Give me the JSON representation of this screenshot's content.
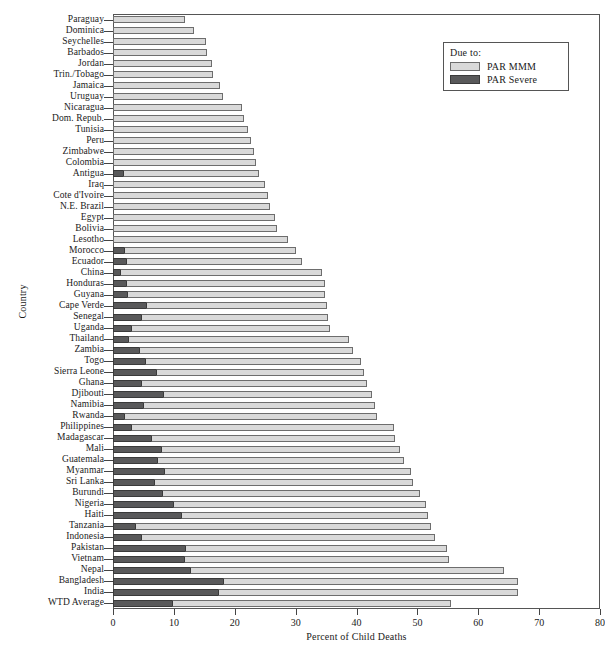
{
  "chart_data": {
    "type": "bar",
    "orientation": "horizontal",
    "stacked": true,
    "title": "",
    "xlabel": "Percent of Child Deaths",
    "ylabel": "Country",
    "xlim": [
      0,
      80
    ],
    "xticks": [
      0,
      10,
      20,
      30,
      40,
      50,
      60,
      70,
      80
    ],
    "xtick_labels": [
      "0",
      "10",
      "20",
      "30",
      "40",
      "50",
      "60",
      "70",
      "80"
    ],
    "grid": false,
    "legend": {
      "title": "Due to:",
      "position": "top-right",
      "entries": [
        {
          "name": "PAR MMM",
          "color": "#d9d9d9"
        },
        {
          "name": "PAR Severe",
          "color": "#59595a"
        }
      ]
    },
    "series": [
      {
        "name": "PAR Severe",
        "color": "#59595a"
      },
      {
        "name": "PAR MMM",
        "color": "#d9d9d9"
      }
    ],
    "categories": [
      "Paraguay",
      "Dominica",
      "Seychelles",
      "Barbados",
      "Jordan",
      "Trin./Tobago",
      "Jamaica",
      "Uruguay",
      "Nicaragua",
      "Dom. Repub.",
      "Tunisia",
      "Peru",
      "Zimbabwe",
      "Colombia",
      "Antigua",
      "Iraq",
      "Cote d'Ivoire",
      "N.E. Brazil",
      "Egypt",
      "Bolivia",
      "Lesotho",
      "Morocco",
      "Ecuador",
      "China",
      "Honduras",
      "Guyana",
      "Cape Verde",
      "Senegal",
      "Uganda",
      "Thailand",
      "Zambia",
      "Togo",
      "Sierra Leone",
      "Ghana",
      "Djibouti",
      "Namibia",
      "Rwanda",
      "Philippines",
      "Madagascar",
      "Mali",
      "Guatemala",
      "Myanmar",
      "Sri Lanka",
      "Burundi",
      "Nigeria",
      "Haiti",
      "Tanzania",
      "Indonesia",
      "Pakistan",
      "Vietnam",
      "Nepal",
      "Bangladesh",
      "India",
      "WTD Average"
    ],
    "rows": [
      {
        "country": "Paraguay",
        "severe": 0.0,
        "mmm": 11.9,
        "total": 11.9
      },
      {
        "country": "Dominica",
        "severe": 0.0,
        "mmm": 13.3,
        "total": 13.3
      },
      {
        "country": "Seychelles",
        "severe": 0.0,
        "mmm": 15.2,
        "total": 15.2
      },
      {
        "country": "Barbados",
        "severe": 0.0,
        "mmm": 15.4,
        "total": 15.4
      },
      {
        "country": "Jordan",
        "severe": 0.0,
        "mmm": 16.3,
        "total": 16.3
      },
      {
        "country": "Trin./Tobago",
        "severe": 0.0,
        "mmm": 16.5,
        "total": 16.5
      },
      {
        "country": "Jamaica",
        "severe": 0.0,
        "mmm": 17.5,
        "total": 17.5
      },
      {
        "country": "Uruguay",
        "severe": 0.0,
        "mmm": 18.1,
        "total": 18.1
      },
      {
        "country": "Nicaragua",
        "severe": 0.0,
        "mmm": 21.2,
        "total": 21.2
      },
      {
        "country": "Dom. Repub.",
        "severe": 0.0,
        "mmm": 21.6,
        "total": 21.6
      },
      {
        "country": "Tunisia",
        "severe": 0.0,
        "mmm": 22.1,
        "total": 22.1
      },
      {
        "country": "Peru",
        "severe": 0.0,
        "mmm": 22.6,
        "total": 22.6
      },
      {
        "country": "Zimbabwe",
        "severe": 0.0,
        "mmm": 23.1,
        "total": 23.1
      },
      {
        "country": "Colombia",
        "severe": 0.0,
        "mmm": 23.5,
        "total": 23.5
      },
      {
        "country": "Antigua",
        "severe": 1.6,
        "mmm": 22.4,
        "total": 24.0
      },
      {
        "country": "Iraq",
        "severe": 0.0,
        "mmm": 24.9,
        "total": 24.9
      },
      {
        "country": "Cote d'Ivoire",
        "severe": 0.0,
        "mmm": 25.5,
        "total": 25.5
      },
      {
        "country": "N.E. Brazil",
        "severe": 0.0,
        "mmm": 25.8,
        "total": 25.8
      },
      {
        "country": "Egypt",
        "severe": 0.0,
        "mmm": 26.6,
        "total": 26.6
      },
      {
        "country": "Bolivia",
        "severe": 0.0,
        "mmm": 27.0,
        "total": 27.0
      },
      {
        "country": "Lesotho",
        "severe": 0.0,
        "mmm": 28.8,
        "total": 28.8
      },
      {
        "country": "Morocco",
        "severe": 1.8,
        "mmm": 28.2,
        "total": 30.0
      },
      {
        "country": "Ecuador",
        "severe": 2.2,
        "mmm": 28.8,
        "total": 31.0
      },
      {
        "country": "China",
        "severe": 1.1,
        "mmm": 33.3,
        "total": 34.4
      },
      {
        "country": "Honduras",
        "severe": 2.2,
        "mmm": 32.6,
        "total": 34.8
      },
      {
        "country": "Guyana",
        "severe": 2.3,
        "mmm": 32.6,
        "total": 34.9
      },
      {
        "country": "Cape Verde",
        "severe": 5.4,
        "mmm": 29.7,
        "total": 35.1
      },
      {
        "country": "Senegal",
        "severe": 4.6,
        "mmm": 30.8,
        "total": 35.4
      },
      {
        "country": "Uganda",
        "severe": 2.9,
        "mmm": 32.7,
        "total": 35.6
      },
      {
        "country": "Thailand",
        "severe": 2.4,
        "mmm": 36.4,
        "total": 38.8
      },
      {
        "country": "Zambia",
        "severe": 4.3,
        "mmm": 35.2,
        "total": 39.5
      },
      {
        "country": "Togo",
        "severe": 5.3,
        "mmm": 35.4,
        "total": 40.7
      },
      {
        "country": "Sierra Leone",
        "severe": 7.1,
        "mmm": 34.2,
        "total": 41.3
      },
      {
        "country": "Ghana",
        "severe": 4.6,
        "mmm": 37.1,
        "total": 41.7
      },
      {
        "country": "Djibouti",
        "severe": 8.2,
        "mmm": 34.3,
        "total": 42.5
      },
      {
        "country": "Namibia",
        "severe": 4.9,
        "mmm": 38.1,
        "total": 43.0
      },
      {
        "country": "Rwanda",
        "severe": 1.8,
        "mmm": 41.6,
        "total": 43.4
      },
      {
        "country": "Philippines",
        "severe": 3.0,
        "mmm": 43.1,
        "total": 46.1
      },
      {
        "country": "Madagascar",
        "severe": 6.3,
        "mmm": 40.1,
        "total": 46.4
      },
      {
        "country": "Mali",
        "severe": 7.9,
        "mmm": 39.3,
        "total": 47.2
      },
      {
        "country": "Guatemala",
        "severe": 7.3,
        "mmm": 40.5,
        "total": 47.8
      },
      {
        "country": "Myanmar",
        "severe": 8.3,
        "mmm": 40.6,
        "total": 48.9
      },
      {
        "country": "Sri Lanka",
        "severe": 6.8,
        "mmm": 42.5,
        "total": 49.3
      },
      {
        "country": "Burundi",
        "severe": 8.1,
        "mmm": 42.4,
        "total": 50.5
      },
      {
        "country": "Nigeria",
        "severe": 9.9,
        "mmm": 41.5,
        "total": 51.4
      },
      {
        "country": "Haiti",
        "severe": 11.2,
        "mmm": 40.6,
        "total": 51.8
      },
      {
        "country": "Tanzania",
        "severe": 3.6,
        "mmm": 48.6,
        "total": 52.2
      },
      {
        "country": "Indonesia",
        "severe": 4.6,
        "mmm": 48.3,
        "total": 52.9
      },
      {
        "country": "Pakistan",
        "severe": 11.9,
        "mmm": 42.9,
        "total": 54.8
      },
      {
        "country": "Vietnam",
        "severe": 11.7,
        "mmm": 43.5,
        "total": 55.2
      },
      {
        "country": "Nepal",
        "severe": 12.7,
        "mmm": 51.5,
        "total": 64.2
      },
      {
        "country": "Bangladesh",
        "severe": 18.1,
        "mmm": 48.4,
        "total": 66.5
      },
      {
        "country": "India",
        "severe": 17.2,
        "mmm": 49.3,
        "total": 66.5
      },
      {
        "country": "WTD Average",
        "severe": 9.7,
        "mmm": 45.8,
        "total": 55.5
      }
    ]
  }
}
